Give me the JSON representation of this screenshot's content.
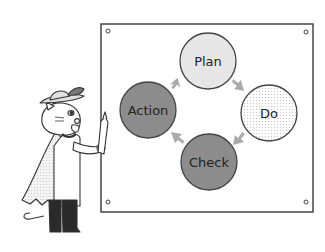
{
  "diagram": {
    "nodes": [
      {
        "id": "plan",
        "label": "Plan",
        "fill": "#e6e6e6",
        "pattern": "solid"
      },
      {
        "id": "do",
        "label": "Do",
        "fill": "#ffffff",
        "pattern": "dotted"
      },
      {
        "id": "check",
        "label": "Check",
        "fill": "#8c8c8c",
        "pattern": "solid"
      },
      {
        "id": "action",
        "label": "Action",
        "fill": "#8c8c8c",
        "pattern": "solid"
      }
    ],
    "edges": [
      {
        "from": "plan",
        "to": "do"
      },
      {
        "from": "do",
        "to": "check"
      },
      {
        "from": "check",
        "to": "action"
      },
      {
        "from": "action",
        "to": "plan"
      }
    ],
    "arrow_color": "#aaaaaa"
  },
  "illustration": {
    "character": "cat-in-hat-with-cape-holding-pencil"
  }
}
